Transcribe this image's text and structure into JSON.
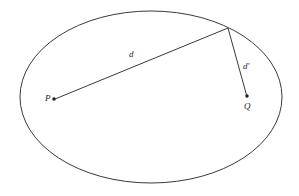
{
  "figure": {
    "background_color": "#ffffff",
    "stroke_color": "#3a3a3a",
    "point_color": "#1d1d1d",
    "label_color": "#1d1d1d",
    "width": 299,
    "height": 196
  },
  "shapes": {
    "ellipse": {
      "name": "boundary-ellipse",
      "cx": 151,
      "cy": 97,
      "rx": 131,
      "ry": 86,
      "stroke_width": 1
    }
  },
  "points": [
    {
      "id": "P",
      "label": "P",
      "x": 54,
      "y": 99,
      "radius": 1.7
    },
    {
      "id": "Q",
      "label": "Q",
      "x": 247,
      "y": 96,
      "radius": 1.7
    },
    {
      "id": "V",
      "label": "",
      "x": 228,
      "y": 28,
      "radius": 0
    }
  ],
  "segments": [
    {
      "id": "d",
      "label": "d",
      "from": "P",
      "to": "V",
      "x1": 55,
      "y1": 99,
      "x2": 228,
      "y2": 28,
      "stroke_width": 1
    },
    {
      "id": "d-prime",
      "label": "d",
      "prime": "′",
      "from": "V",
      "to": "Q",
      "x1": 228,
      "y1": 28,
      "x2": 246.5,
      "y2": 95,
      "stroke_width": 1
    }
  ],
  "labels": {
    "d": "d",
    "d_prime_base": "d",
    "d_prime_mark": "′",
    "p": "P",
    "q": "Q"
  }
}
